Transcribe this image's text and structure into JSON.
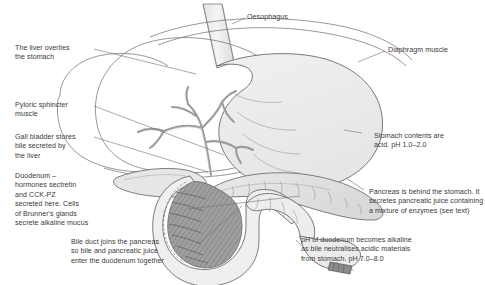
{
  "figure": {
    "background_color": "#ffffff",
    "line_color": "#6e6e6e",
    "text_color": "#3a3a3a",
    "organ_fill_light": "#eeeeee",
    "organ_fill_mid": "#d8d8d8",
    "organ_fill_dark": "#9a9a9a"
  },
  "labels": {
    "oesophagus": "Oesophagus",
    "liver": "The liver overlies\nthe stomach",
    "diaphragm": "Diaphragm muscle",
    "pyloric_sphincter": "Pyloric sphincter\nmuscle",
    "gall_bladder": "Gall bladder stores\nbile secreted by\nthe liver",
    "stomach_ph": "Stomach contents are\nacid. pH 1.0–2.0",
    "duodenum": "Duodenum –\nhormones sectretin\nand CCK-PZ\nsecreted here. Cells\nof Brunner's glands\nsecrete alkaline mucus",
    "pancreas": "Pancreas is behind the stomach. It\nsecretes pancreatic juice containing\na mixture of enzymes (see text)",
    "bile_duct": "Bile duct joins the pancreas\nso bile and pancreatic juice\nenter the duodenum together",
    "ph_duodenum": "pH of duodenum becomes alkaline\nas bile neutralises acidic materials\nfrom stomach. pH 7.0–8.0"
  }
}
